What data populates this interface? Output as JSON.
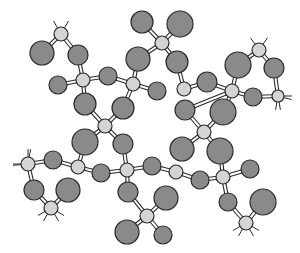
{
  "diagram": {
    "type": "ball-and-stick molecular structure",
    "colors": {
      "background": "#ffffff",
      "large_atom": "#8a8a8a",
      "small_atom": "#d4d4d4",
      "outline": "#2a2a2a",
      "bond_fill": "#ffffff"
    },
    "atoms": [
      {
        "id": "a1",
        "x": 61,
        "y": 34,
        "r": 7,
        "kind": "small"
      },
      {
        "id": "a2",
        "x": 42,
        "y": 53,
        "r": 12,
        "kind": "large"
      },
      {
        "id": "a3",
        "x": 78,
        "y": 55,
        "r": 10,
        "kind": "large"
      },
      {
        "id": "a4",
        "x": 83,
        "y": 80,
        "r": 7,
        "kind": "small"
      },
      {
        "id": "a5",
        "x": 58,
        "y": 85,
        "r": 9,
        "kind": "large"
      },
      {
        "id": "a6",
        "x": 108,
        "y": 76,
        "r": 9,
        "kind": "large"
      },
      {
        "id": "a7",
        "x": 133,
        "y": 84,
        "r": 7,
        "kind": "small"
      },
      {
        "id": "a8",
        "x": 85,
        "y": 104,
        "r": 11,
        "kind": "large"
      },
      {
        "id": "a9",
        "x": 123,
        "y": 108,
        "r": 11,
        "kind": "large"
      },
      {
        "id": "a10",
        "x": 105,
        "y": 126,
        "r": 7,
        "kind": "small"
      },
      {
        "id": "a11",
        "x": 142,
        "y": 22,
        "r": 11,
        "kind": "large"
      },
      {
        "id": "a12",
        "x": 138,
        "y": 59,
        "r": 12,
        "kind": "large"
      },
      {
        "id": "a13",
        "x": 162,
        "y": 43,
        "r": 7,
        "kind": "small"
      },
      {
        "id": "a14",
        "x": 180,
        "y": 24,
        "r": 13,
        "kind": "large"
      },
      {
        "id": "a15",
        "x": 177,
        "y": 62,
        "r": 11,
        "kind": "large"
      },
      {
        "id": "a16",
        "x": 157,
        "y": 91,
        "r": 9,
        "kind": "large"
      },
      {
        "id": "a17",
        "x": 184,
        "y": 89,
        "r": 7,
        "kind": "small"
      },
      {
        "id": "a18",
        "x": 207,
        "y": 82,
        "r": 10,
        "kind": "large"
      },
      {
        "id": "a19",
        "x": 238,
        "y": 65,
        "r": 13,
        "kind": "large"
      },
      {
        "id": "a20",
        "x": 259,
        "y": 50,
        "r": 7,
        "kind": "small"
      },
      {
        "id": "a21",
        "x": 274,
        "y": 68,
        "r": 10,
        "kind": "large"
      },
      {
        "id": "a22",
        "x": 232,
        "y": 91,
        "r": 7,
        "kind": "small"
      },
      {
        "id": "a23",
        "x": 253,
        "y": 97,
        "r": 9,
        "kind": "large"
      },
      {
        "id": "a24",
        "x": 278,
        "y": 96,
        "r": 6,
        "kind": "small"
      },
      {
        "id": "a25",
        "x": 185,
        "y": 110,
        "r": 10,
        "kind": "large"
      },
      {
        "id": "a26",
        "x": 223,
        "y": 112,
        "r": 13,
        "kind": "large"
      },
      {
        "id": "a27",
        "x": 204,
        "y": 132,
        "r": 7,
        "kind": "small"
      },
      {
        "id": "a28",
        "x": 182,
        "y": 149,
        "r": 12,
        "kind": "large"
      },
      {
        "id": "a29",
        "x": 220,
        "y": 151,
        "r": 13,
        "kind": "large"
      },
      {
        "id": "a30",
        "x": 85,
        "y": 142,
        "r": 13,
        "kind": "large"
      },
      {
        "id": "a31",
        "x": 123,
        "y": 144,
        "r": 10,
        "kind": "large"
      },
      {
        "id": "a32",
        "x": 28,
        "y": 164,
        "r": 7,
        "kind": "small"
      },
      {
        "id": "a33",
        "x": 53,
        "y": 160,
        "r": 9,
        "kind": "large"
      },
      {
        "id": "a34",
        "x": 78,
        "y": 167,
        "r": 7,
        "kind": "small"
      },
      {
        "id": "a35",
        "x": 101,
        "y": 173,
        "r": 9,
        "kind": "large"
      },
      {
        "id": "a36",
        "x": 127,
        "y": 170,
        "r": 7,
        "kind": "small"
      },
      {
        "id": "a37",
        "x": 152,
        "y": 166,
        "r": 9,
        "kind": "large"
      },
      {
        "id": "a38",
        "x": 176,
        "y": 172,
        "r": 7,
        "kind": "small"
      },
      {
        "id": "a39",
        "x": 200,
        "y": 180,
        "r": 9,
        "kind": "large"
      },
      {
        "id": "a40",
        "x": 223,
        "y": 177,
        "r": 7,
        "kind": "small"
      },
      {
        "id": "a41",
        "x": 250,
        "y": 169,
        "r": 9,
        "kind": "large"
      },
      {
        "id": "a42",
        "x": 34,
        "y": 190,
        "r": 10,
        "kind": "large"
      },
      {
        "id": "a43",
        "x": 68,
        "y": 190,
        "r": 12,
        "kind": "large"
      },
      {
        "id": "a44",
        "x": 51,
        "y": 208,
        "r": 7,
        "kind": "small"
      },
      {
        "id": "a45",
        "x": 128,
        "y": 192,
        "r": 10,
        "kind": "large"
      },
      {
        "id": "a46",
        "x": 166,
        "y": 198,
        "r": 12,
        "kind": "large"
      },
      {
        "id": "a47",
        "x": 147,
        "y": 216,
        "r": 7,
        "kind": "small"
      },
      {
        "id": "a48",
        "x": 127,
        "y": 232,
        "r": 12,
        "kind": "large"
      },
      {
        "id": "a49",
        "x": 163,
        "y": 235,
        "r": 9,
        "kind": "large"
      },
      {
        "id": "a50",
        "x": 228,
        "y": 202,
        "r": 9,
        "kind": "large"
      },
      {
        "id": "a51",
        "x": 263,
        "y": 202,
        "r": 13,
        "kind": "large"
      },
      {
        "id": "a52",
        "x": 246,
        "y": 223,
        "r": 7,
        "kind": "small"
      }
    ],
    "bonds": [
      [
        "a1",
        "a2"
      ],
      [
        "a1",
        "a3"
      ],
      [
        "a3",
        "a4"
      ],
      [
        "a4",
        "a5"
      ],
      [
        "a4",
        "a6"
      ],
      [
        "a6",
        "a7"
      ],
      [
        "a4",
        "a8"
      ],
      [
        "a8",
        "a10"
      ],
      [
        "a7",
        "a9"
      ],
      [
        "a9",
        "a10"
      ],
      [
        "a7",
        "a12"
      ],
      [
        "a7",
        "a16"
      ],
      [
        "a13",
        "a11"
      ],
      [
        "a13",
        "a14"
      ],
      [
        "a13",
        "a12"
      ],
      [
        "a13",
        "a15"
      ],
      [
        "a15",
        "a17"
      ],
      [
        "a17",
        "a18"
      ],
      [
        "a18",
        "a22"
      ],
      [
        "a22",
        "a19"
      ],
      [
        "a19",
        "a20"
      ],
      [
        "a20",
        "a21"
      ],
      [
        "a21",
        "a24"
      ],
      [
        "a22",
        "a23"
      ],
      [
        "a23",
        "a24"
      ],
      [
        "a22",
        "a25"
      ],
      [
        "a22",
        "a26"
      ],
      [
        "a25",
        "a27"
      ],
      [
        "a26",
        "a27"
      ],
      [
        "a27",
        "a28"
      ],
      [
        "a27",
        "a29"
      ],
      [
        "a10",
        "a30"
      ],
      [
        "a10",
        "a31"
      ],
      [
        "a30",
        "a34"
      ],
      [
        "a32",
        "a33"
      ],
      [
        "a33",
        "a34"
      ],
      [
        "a34",
        "a35"
      ],
      [
        "a35",
        "a36"
      ],
      [
        "a36",
        "a37"
      ],
      [
        "a37",
        "a38"
      ],
      [
        "a38",
        "a39"
      ],
      [
        "a39",
        "a40"
      ],
      [
        "a40",
        "a41"
      ],
      [
        "a40",
        "a29"
      ],
      [
        "a31",
        "a36"
      ],
      [
        "a32",
        "a42"
      ],
      [
        "a42",
        "a44"
      ],
      [
        "a43",
        "a44"
      ],
      [
        "a36",
        "a45"
      ],
      [
        "a45",
        "a47"
      ],
      [
        "a46",
        "a47"
      ],
      [
        "a47",
        "a48"
      ],
      [
        "a47",
        "a49"
      ],
      [
        "a40",
        "a50"
      ],
      [
        "a50",
        "a52"
      ],
      [
        "a51",
        "a52"
      ]
    ],
    "stubs": [
      {
        "atom": "a1",
        "angles": [
          -120,
          -60
        ]
      },
      {
        "atom": "a20",
        "angles": [
          -125,
          -55
        ]
      },
      {
        "atom": "a24",
        "angles": [
          0,
          15,
          80,
          100
        ]
      },
      {
        "atom": "a32",
        "angles": [
          180,
          175,
          -90,
          -80
        ]
      },
      {
        "atom": "a44",
        "angles": [
          120,
          60,
          150,
          30
        ]
      },
      {
        "atom": "a52",
        "angles": [
          120,
          60,
          150,
          30
        ]
      }
    ]
  }
}
